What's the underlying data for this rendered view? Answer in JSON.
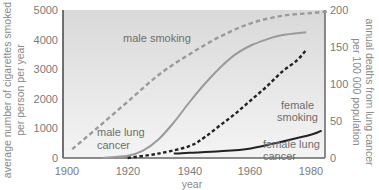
{
  "chart_data": {
    "type": "line",
    "title": "",
    "xlabel": "year",
    "ylabel_left": "average number of cigarettes smoked per person per year",
    "ylabel_right": "annual deaths from lung cancer per 100 000 population",
    "xlim": [
      1900,
      1985
    ],
    "ylim_left": [
      0,
      5000
    ],
    "ylim_right": [
      0,
      200
    ],
    "x_ticks": [
      "1900",
      "1920",
      "1940",
      "1960",
      "1980"
    ],
    "y_ticks_left": [
      "0",
      "1000",
      "2000",
      "3000",
      "4000",
      "5000"
    ],
    "y_ticks_right": [
      "0",
      "50",
      "100",
      "150",
      "200"
    ],
    "grid": false,
    "legend": "inline annotations",
    "series": [
      {
        "name": "male smoking",
        "axis": "left",
        "style": "dashed",
        "color": "#9a9a9a",
        "x": [
          1902,
          1910,
          1920,
          1930,
          1940,
          1950,
          1960,
          1970,
          1980,
          1985
        ],
        "values": [
          300,
          1000,
          1900,
          2800,
          3500,
          4100,
          4550,
          4800,
          4900,
          4950
        ]
      },
      {
        "name": "male lung cancer",
        "axis": "right",
        "style": "solid",
        "color": "#9a9a9a",
        "x": [
          1912,
          1920,
          1925,
          1930,
          1935,
          1940,
          1945,
          1950,
          1955,
          1960,
          1965,
          1970,
          1978
        ],
        "values": [
          0,
          3,
          10,
          25,
          48,
          75,
          100,
          122,
          140,
          152,
          160,
          166,
          170
        ]
      },
      {
        "name": "female smoking",
        "axis": "left",
        "style": "dashed",
        "color": "#222222",
        "x": [
          1920,
          1930,
          1940,
          1945,
          1950,
          1955,
          1960,
          1965,
          1970,
          1975,
          1978
        ],
        "values": [
          0,
          150,
          400,
          700,
          1100,
          1500,
          1950,
          2400,
          2900,
          3300,
          3650
        ]
      },
      {
        "name": "female lung cancer",
        "axis": "right",
        "style": "solid",
        "color": "#222222",
        "x": [
          1935,
          1940,
          1950,
          1960,
          1970,
          1980,
          1983
        ],
        "values": [
          6,
          7,
          9,
          13,
          22,
          32,
          37
        ]
      }
    ]
  },
  "plot": {
    "background_top": "#d9d9d9",
    "background_bottom": "#f4f4f4",
    "frame_color": "#555555"
  },
  "annotations": {
    "male_smoking": "male smoking",
    "male_lung_cancer_1": "male lung",
    "male_lung_cancer_2": "cancer",
    "female_smoking_1": "female",
    "female_smoking_2": "smoking",
    "female_lung_cancer_1": "female lung",
    "female_lung_cancer_2": "cancer"
  },
  "axes": {
    "left_label_1": "average number of cigarettes smoked",
    "left_label_2": "per person per year",
    "right_label_1": "annual deaths from lung cancer",
    "right_label_2": "per 100 000 population",
    "x_label": "year",
    "x_ticks": [
      "1900",
      "1920",
      "1940",
      "1960",
      "1980"
    ],
    "left_ticks": [
      "5000",
      "4000",
      "3000",
      "2000",
      "1000",
      "0"
    ],
    "right_ticks": [
      "200",
      "150",
      "100",
      "50",
      "0"
    ]
  }
}
